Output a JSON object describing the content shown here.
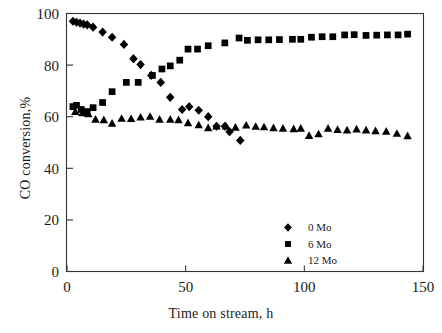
{
  "chart_data": {
    "type": "scatter",
    "title": "",
    "xlabel": "Time on stream, h",
    "ylabel": "CO conversion,%",
    "xlim": [
      0,
      150
    ],
    "ylim": [
      0,
      100
    ],
    "xticks": [
      0,
      50,
      100,
      150
    ],
    "yticks": [
      0,
      20,
      40,
      60,
      80,
      100
    ],
    "grid": false,
    "legend_position": "bottom-right",
    "series": [
      {
        "name": "0 Mo",
        "marker": "diamond",
        "color": "#000000",
        "points": [
          [
            2.5,
            97.0
          ],
          [
            4.0,
            96.6
          ],
          [
            5.5,
            96.3
          ],
          [
            7.0,
            95.9
          ],
          [
            8.5,
            95.6
          ],
          [
            11.0,
            94.7
          ],
          [
            15.0,
            92.8
          ],
          [
            19.0,
            90.8
          ],
          [
            24.0,
            88.0
          ],
          [
            28.0,
            82.5
          ],
          [
            31.0,
            80.2
          ],
          [
            35.5,
            76.0
          ],
          [
            39.5,
            73.3
          ],
          [
            43.5,
            67.5
          ],
          [
            48.5,
            62.8
          ],
          [
            51.5,
            63.9
          ],
          [
            55.5,
            62.5
          ],
          [
            59.5,
            60.0
          ],
          [
            63.0,
            56.3
          ],
          [
            66.5,
            56.3
          ],
          [
            68.5,
            54.2
          ],
          [
            73.0,
            50.8
          ]
        ]
      },
      {
        "name": "6 Mo",
        "marker": "square",
        "color": "#000000",
        "points": [
          [
            2.5,
            63.9
          ],
          [
            4.0,
            64.4
          ],
          [
            6.0,
            62.8
          ],
          [
            8.5,
            62.0
          ],
          [
            11.0,
            63.5
          ],
          [
            15.0,
            65.5
          ],
          [
            19.0,
            69.7
          ],
          [
            25.0,
            73.3
          ],
          [
            30.0,
            73.3
          ],
          [
            36.0,
            76.0
          ],
          [
            40.0,
            78.5
          ],
          [
            43.5,
            79.7
          ],
          [
            47.5,
            81.9
          ],
          [
            51.0,
            86.2
          ],
          [
            55.0,
            86.2
          ],
          [
            59.5,
            87.5
          ],
          [
            66.5,
            88.6
          ],
          [
            72.5,
            90.5
          ],
          [
            76.0,
            89.6
          ],
          [
            80.5,
            89.8
          ],
          [
            85.0,
            89.8
          ],
          [
            89.5,
            89.9
          ],
          [
            95.0,
            90.0
          ],
          [
            98.5,
            90.0
          ],
          [
            103.0,
            90.8
          ],
          [
            107.5,
            91.0
          ],
          [
            112.0,
            91.0
          ],
          [
            117.0,
            91.7
          ],
          [
            121.0,
            91.8
          ],
          [
            126.0,
            91.5
          ],
          [
            130.5,
            91.6
          ],
          [
            135.0,
            91.7
          ],
          [
            139.5,
            91.7
          ],
          [
            143.5,
            92.0
          ]
        ]
      },
      {
        "name": "12 Mo",
        "marker": "triangle",
        "color": "#000000",
        "points": [
          [
            3.5,
            62.0
          ],
          [
            6.5,
            61.5
          ],
          [
            9.0,
            61.1
          ],
          [
            12.0,
            59.0
          ],
          [
            15.5,
            58.8
          ],
          [
            19.0,
            57.4
          ],
          [
            23.0,
            59.3
          ],
          [
            27.0,
            59.2
          ],
          [
            31.0,
            59.8
          ],
          [
            35.0,
            60.1
          ],
          [
            39.0,
            59.0
          ],
          [
            43.5,
            59.0
          ],
          [
            47.0,
            58.8
          ],
          [
            51.0,
            57.6
          ],
          [
            55.5,
            56.8
          ],
          [
            59.5,
            55.7
          ],
          [
            63.0,
            56.3
          ],
          [
            67.0,
            56.3
          ],
          [
            71.0,
            55.9
          ],
          [
            75.5,
            56.7
          ],
          [
            79.5,
            56.2
          ],
          [
            83.0,
            56.0
          ],
          [
            87.0,
            55.7
          ],
          [
            91.0,
            55.5
          ],
          [
            95.5,
            55.3
          ],
          [
            98.5,
            55.5
          ],
          [
            102.0,
            52.7
          ],
          [
            106.0,
            53.3
          ],
          [
            110.0,
            55.5
          ],
          [
            114.0,
            55.0
          ],
          [
            118.0,
            54.8
          ],
          [
            122.0,
            55.2
          ],
          [
            126.0,
            54.8
          ],
          [
            130.0,
            54.5
          ],
          [
            134.5,
            54.3
          ],
          [
            139.0,
            53.5
          ],
          [
            143.5,
            52.6
          ]
        ]
      }
    ],
    "legend": [
      {
        "label": "0 Mo",
        "marker": "diamond"
      },
      {
        "label": "6 Mo",
        "marker": "square"
      },
      {
        "label": "12 Mo",
        "marker": "triangle"
      }
    ]
  }
}
